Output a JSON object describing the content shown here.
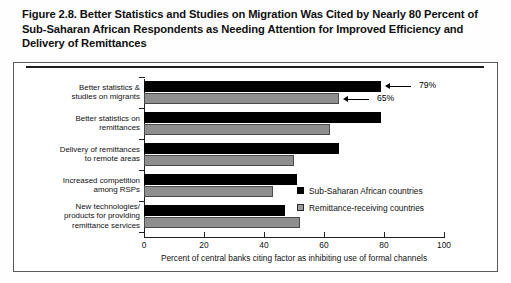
{
  "figure": {
    "title": "Figure 2.8. Better Statistics and Studies on Migration Was Cited by Nearly 80 Percent of Sub-Saharan African Respondents as Needing Attention for Improved Efficiency and Delivery of Remittances"
  },
  "chart_data": {
    "type": "bar",
    "orientation": "horizontal",
    "title": "Figure 2.8. Better Statistics and Studies on Migration Was Cited by Nearly 80 Percent of Sub-Saharan African Respondents as Needing Attention for Improved Efficiency and Delivery of Remittances",
    "categories": [
      "Better statistics &\nstudies on migrants",
      "Better statistics on\nremittances",
      "Delivery of remittances\nto remote areas",
      "Increased competition\namong RSPs",
      "New technologies/\nproducts for providing\nremittance services"
    ],
    "category_lines": [
      [
        "Better statistics &",
        "studies on migrants"
      ],
      [
        "Better statistics on",
        "remittances"
      ],
      [
        "Delivery of remittances",
        "to remote areas"
      ],
      [
        "Increased competition",
        "among RSPs"
      ],
      [
        "New technologies/",
        "products for providing",
        "remittance services"
      ]
    ],
    "series": [
      {
        "name": "Sub-Saharan African countries",
        "color": "#000000",
        "values": [
          79,
          79,
          65,
          51,
          47
        ]
      },
      {
        "name": "Remittance-receiving countries",
        "color": "#8e8e8e",
        "values": [
          65,
          62,
          50,
          43,
          52
        ]
      }
    ],
    "xlabel": "Percent of central banks citing factor as inhibiting use of formal channels",
    "ylabel": "",
    "xlim": [
      0,
      100
    ],
    "xticks": [
      0,
      20,
      40,
      60,
      80,
      100
    ],
    "xtick_labels": [
      "0",
      "20",
      "40",
      "60",
      "80",
      "100"
    ],
    "grid": false,
    "legend_position": "middle-right",
    "annotations": [
      {
        "text": "79%",
        "target_series": "Sub-Saharan African countries",
        "target_category": "Better statistics & studies on migrants",
        "value": 79
      },
      {
        "text": "65%",
        "target_series": "Remittance-receiving countries",
        "target_category": "Better statistics & studies on migrants",
        "value": 65
      }
    ]
  }
}
